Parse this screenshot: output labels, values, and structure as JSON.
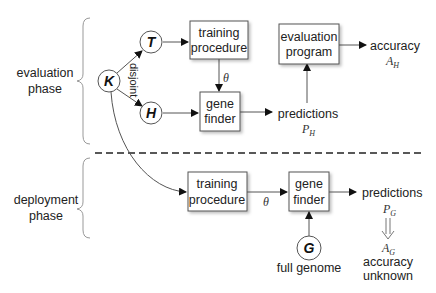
{
  "phases": {
    "evaluation": {
      "line1": "evaluation",
      "line2": "phase"
    },
    "deployment": {
      "line1": "deployment",
      "line2": "phase"
    }
  },
  "nodes": {
    "K": "K",
    "T": "T",
    "H": "H",
    "G": "G"
  },
  "edge_labels": {
    "disjoint": "disjoint",
    "theta_top": "θ",
    "theta_bottom": "θ"
  },
  "evaluation": {
    "training_box": {
      "line1": "training",
      "line2": "procedure"
    },
    "gene_finder_box": {
      "line1": "gene",
      "line2": "finder"
    },
    "evaluation_box": {
      "line1": "evaluation",
      "line2": "program"
    },
    "predictions": {
      "label": "predictions",
      "symbol": "P",
      "subscript": "H"
    },
    "accuracy": {
      "label": "accuracy",
      "symbol": "A",
      "subscript": "H"
    }
  },
  "deployment": {
    "training_box": {
      "line1": "training",
      "line2": "procedure"
    },
    "gene_finder_box": {
      "line1": "gene",
      "line2": "finder"
    },
    "full_genome_label": "full genome",
    "predictions": {
      "label": "predictions",
      "symbol": "P",
      "subscript": "G"
    },
    "accuracy": {
      "symbol": "A",
      "subscript": "G",
      "line1": "accuracy",
      "line2": "unknown"
    }
  },
  "colors": {
    "stroke": "#555555",
    "brace": "#999999",
    "text": "#222222",
    "dash": "#222222"
  }
}
